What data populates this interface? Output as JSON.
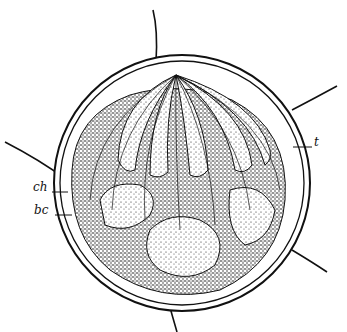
{
  "figure": {
    "labels": {
      "ch": "ch",
      "bc": "bc",
      "t": "t"
    },
    "colors": {
      "ink": "#111111",
      "background": "#ffffff"
    }
  }
}
